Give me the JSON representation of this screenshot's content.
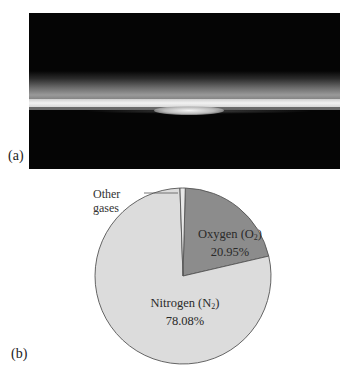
{
  "panel_a": {
    "label": "(a)",
    "image_description": "Earth's limb photographed from space showing a thin bright atmosphere band above a dark horizon"
  },
  "panel_b": {
    "label": "(b)"
  },
  "chart_data": {
    "type": "pie",
    "title": "",
    "categories": [
      "Oxygen (O2)",
      "Nitrogen (N2)",
      "Other gases"
    ],
    "values": [
      20.95,
      78.08,
      0.97
    ],
    "labels": [
      {
        "name": "Oxygen",
        "formula_sub": "2",
        "formula_base": "O",
        "value_text": "20.95%"
      },
      {
        "name": "Nitrogen",
        "formula_sub": "2",
        "formula_base": "N",
        "value_text": "78.08%"
      },
      {
        "name": "Other gases",
        "value_text": ""
      }
    ],
    "colors": {
      "oxygen": "#8c8c8c",
      "nitrogen": "#dcdcdc",
      "other": "#e8e8e8",
      "outline": "#555555"
    },
    "start_angle_deg": 0,
    "direction": "clockwise",
    "legend": "none (direct labels)"
  },
  "text": {
    "oxygen_name": "Oxygen (O",
    "oxygen_sub": "2",
    "oxygen_close": ")",
    "oxygen_value": "20.95%",
    "nitrogen_name": "Nitrogen (N",
    "nitrogen_sub": "2",
    "nitrogen_close": ")",
    "nitrogen_value": "78.08%",
    "other_line1": "Other",
    "other_line2": "gases"
  }
}
